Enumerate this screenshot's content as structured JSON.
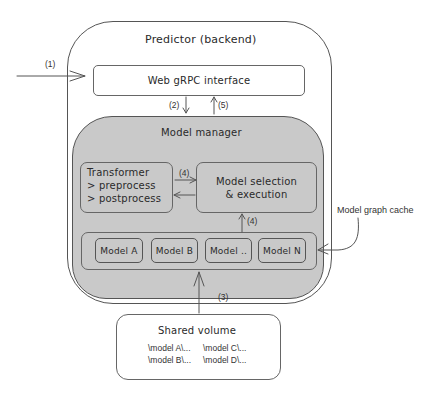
{
  "title": "Predictor (backend)",
  "web_interface": "Web gRPC interface",
  "model_manager": "Model manager",
  "transformer": {
    "title": "Transformer",
    "lines": [
      "> preprocess",
      "> postprocess"
    ]
  },
  "model_selection": {
    "line1": "Model selection",
    "line2": "& execution"
  },
  "models": [
    "Model A",
    "Model B",
    "Model ..",
    "Model N"
  ],
  "model_graph_cache": "Model graph cache",
  "shared_volume": {
    "title": "Shared volume",
    "paths": [
      "\\model A\\...",
      "\\model C\\...",
      "\\model B\\...",
      "\\model D\\..."
    ]
  },
  "step_labels": {
    "s1": "(1)",
    "s2": "(2)",
    "s5": "(5)",
    "s4a": "(4)",
    "s4b": "(4)",
    "s3": "(3)"
  },
  "colors": {
    "manager_fill": "#c9c9c9",
    "stroke": "#555555",
    "background": "#ffffff"
  }
}
